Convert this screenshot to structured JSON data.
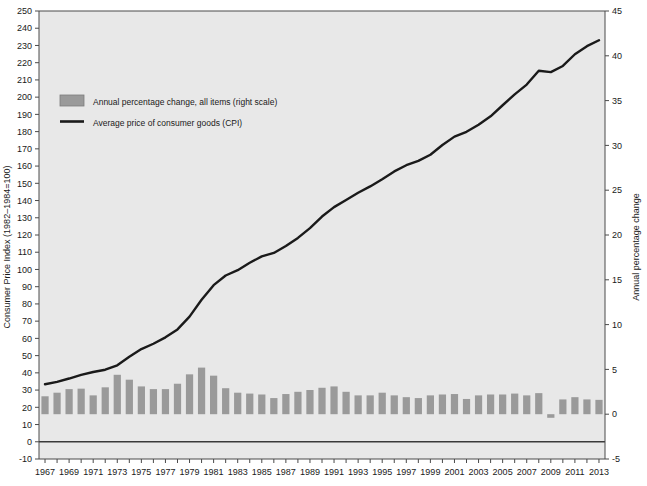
{
  "chart_data": {
    "type": "bar",
    "title": "",
    "subtitle": "",
    "xlabel": "",
    "ylabel": "Consumer Price Index (1982–1984=100)",
    "y2label": "Annual percentage change",
    "grid": false,
    "legend_position": "upper-left",
    "ylim": [
      -10,
      250
    ],
    "y2lim": [
      -5,
      45
    ],
    "xlim": [
      1966.5,
      2013.5
    ],
    "yticks": [
      -10,
      0,
      10,
      20,
      30,
      40,
      50,
      60,
      70,
      80,
      90,
      100,
      110,
      120,
      130,
      140,
      150,
      160,
      170,
      180,
      190,
      200,
      210,
      220,
      230,
      240,
      250
    ],
    "y2ticks": [
      -5,
      0,
      5,
      10,
      15,
      20,
      25,
      30,
      35,
      40,
      45
    ],
    "x_tick_years": [
      1967,
      1968,
      1969,
      1970,
      1971,
      1972,
      1973,
      1974,
      1975,
      1976,
      1977,
      1978,
      1979,
      1980,
      1981,
      1982,
      1983,
      1984,
      1985,
      1986,
      1987,
      1988,
      1989,
      1990,
      1991,
      1992,
      1993,
      1994,
      1995,
      1996,
      1997,
      1998,
      1999,
      2000,
      2001,
      2002,
      2003,
      2004,
      2005,
      2006,
      2007,
      2008,
      2009,
      2010,
      2011,
      2012,
      2013
    ],
    "x_labeled_years": [
      1967,
      1969,
      1971,
      1973,
      1975,
      1977,
      1979,
      1981,
      1983,
      1985,
      1987,
      1989,
      1991,
      1993,
      1995,
      1997,
      1999,
      2001,
      2003,
      2005,
      2007,
      2009,
      2011,
      2013
    ],
    "categories": [
      1967,
      1968,
      1969,
      1970,
      1971,
      1972,
      1973,
      1974,
      1975,
      1976,
      1977,
      1978,
      1979,
      1980,
      1981,
      1982,
      1983,
      1984,
      1985,
      1986,
      1987,
      1988,
      1989,
      1990,
      1991,
      1992,
      1993,
      1994,
      1995,
      1996,
      1997,
      1998,
      1999,
      2000,
      2001,
      2002,
      2003,
      2004,
      2005,
      2006,
      2007,
      2008,
      2009,
      2010,
      2011,
      2012,
      2013
    ],
    "series": [
      {
        "name": "Annual percentage change, all items (right scale)",
        "type": "bar",
        "axis": "right",
        "color": "#9a9a9a",
        "values": [
          2.0,
          2.4,
          2.8,
          2.85,
          2.1,
          3.0,
          4.4,
          3.85,
          3.1,
          2.8,
          2.8,
          3.4,
          4.45,
          5.2,
          4.3,
          2.9,
          2.4,
          2.3,
          2.2,
          1.8,
          2.25,
          2.5,
          2.7,
          2.95,
          3.1,
          2.5,
          2.1,
          2.1,
          2.4,
          2.1,
          1.9,
          1.8,
          2.1,
          2.2,
          2.25,
          1.7,
          2.1,
          2.2,
          2.2,
          2.3,
          2.1,
          2.35,
          -0.4,
          1.65,
          1.9,
          1.65,
          1.6
        ]
      },
      {
        "name": "Average price of consumer goods (CPI)",
        "type": "line",
        "axis": "left",
        "color": "#1a1a1a",
        "values": [
          33.4,
          34.8,
          36.7,
          38.8,
          40.5,
          41.8,
          44.4,
          49.3,
          53.8,
          56.9,
          60.6,
          65.2,
          72.6,
          82.4,
          90.9,
          96.5,
          99.6,
          103.9,
          107.6,
          109.6,
          113.6,
          118.3,
          124.0,
          130.7,
          136.2,
          140.3,
          144.5,
          148.2,
          152.4,
          156.9,
          160.5,
          163.0,
          166.6,
          172.2,
          177.1,
          179.9,
          184.0,
          188.9,
          195.3,
          201.6,
          207.3,
          215.3,
          214.5,
          218.1,
          224.9,
          229.6,
          233.0
        ]
      }
    ]
  },
  "legend": {
    "entries": [
      {
        "label": "Annual percentage change, all items (right scale)",
        "marker": "swatch",
        "color": "#9a9a9a"
      },
      {
        "label": "Average price of consumer goods (CPI)",
        "marker": "line",
        "color": "#1a1a1a"
      }
    ]
  },
  "colors": {
    "plot_background": "#e8e8e8",
    "page_background": "#ffffff",
    "bar": "#9a9a9a",
    "line": "#1a1a1a",
    "axis": "#4a4a4a",
    "text": "#1a1a1a"
  }
}
